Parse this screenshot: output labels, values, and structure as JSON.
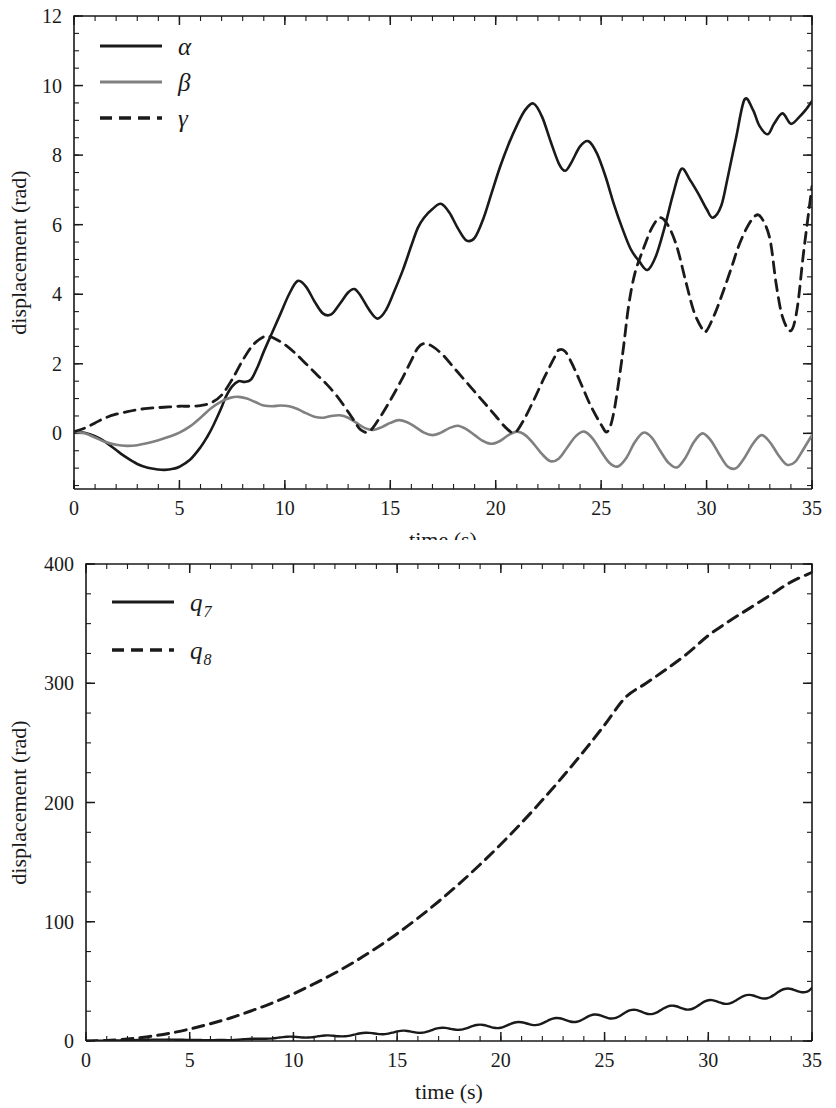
{
  "figure": {
    "background": "#ffffff",
    "ink": "#1a1a1a"
  },
  "chart_data": [
    {
      "id": "top",
      "type": "line",
      "title": "",
      "xlabel": "time (s)",
      "ylabel": "displacement (rad)",
      "xlim": [
        0,
        35
      ],
      "ylim": [
        -1.6,
        12
      ],
      "xticks": [
        0,
        5,
        10,
        15,
        20,
        25,
        30,
        35
      ],
      "xticklabels": [
        "0",
        "5",
        "10",
        "15",
        "20",
        "25",
        "30",
        "35"
      ],
      "yticks": [
        0,
        2,
        4,
        6,
        8,
        10,
        12
      ],
      "yticklabels": [
        "0",
        "2",
        "4",
        "6",
        "8",
        "10",
        "12"
      ],
      "x_minor_step": 1,
      "y_minor_step": 0.5,
      "grid": false,
      "legend_position": "upper-left",
      "legend": [
        {
          "label": "α",
          "style": "solid",
          "color": "#1a1a1a"
        },
        {
          "label": "β",
          "style": "solid",
          "color": "#808080"
        },
        {
          "label": "γ",
          "style": "dashed",
          "color": "#1a1a1a"
        }
      ],
      "series": [
        {
          "name": "α",
          "style": "solid",
          "color": "#1a1a1a",
          "width": 2.6,
          "x": [
            0,
            0.5,
            1,
            1.5,
            2,
            2.5,
            3,
            3.5,
            4,
            4.3,
            4.7,
            5,
            5.5,
            6,
            6.3,
            6.6,
            7,
            7.2,
            7.5,
            7.8,
            8.1,
            8.4,
            8.7,
            9,
            9.4,
            9.8,
            10.2,
            10.6,
            11,
            11.4,
            11.8,
            12.2,
            12.6,
            13,
            13.3,
            13.6,
            14,
            14.4,
            14.8,
            15.2,
            15.6,
            16,
            16.3,
            16.6,
            17,
            17.4,
            17.8,
            18.2,
            18.6,
            19,
            19.4,
            19.8,
            20.2,
            20.6,
            21,
            21.4,
            21.8,
            22.2,
            22.6,
            23,
            23.3,
            23.6,
            24,
            24.4,
            24.8,
            25.2,
            25.6,
            26,
            26.4,
            26.8,
            27.2,
            27.6,
            28,
            28.4,
            28.8,
            29.2,
            29.6,
            30,
            30.3,
            30.7,
            31,
            31.4,
            31.8,
            32.2,
            32.5,
            32.9,
            33.2,
            33.6,
            34,
            34.4,
            34.7,
            35
          ],
          "y": [
            0.05,
            0.02,
            -0.08,
            -0.25,
            -0.48,
            -0.7,
            -0.88,
            -0.99,
            -1.04,
            -1.05,
            -1.02,
            -0.96,
            -0.76,
            -0.4,
            -0.12,
            0.22,
            0.75,
            1.05,
            1.35,
            1.5,
            1.48,
            1.55,
            1.9,
            2.35,
            2.9,
            3.45,
            4.0,
            4.38,
            4.22,
            3.8,
            3.45,
            3.42,
            3.72,
            4.05,
            4.15,
            3.95,
            3.55,
            3.3,
            3.55,
            4.1,
            4.7,
            5.4,
            5.9,
            6.2,
            6.45,
            6.6,
            6.35,
            5.9,
            5.55,
            5.62,
            6.15,
            6.9,
            7.65,
            8.3,
            8.85,
            9.3,
            9.48,
            9.1,
            8.4,
            7.75,
            7.55,
            7.8,
            8.25,
            8.4,
            8.05,
            7.4,
            6.6,
            5.9,
            5.3,
            4.95,
            4.7,
            5.1,
            5.9,
            6.85,
            7.6,
            7.3,
            6.9,
            6.45,
            6.2,
            6.55,
            7.35,
            8.5,
            9.6,
            9.3,
            8.85,
            8.6,
            8.9,
            9.2,
            8.9,
            9.1,
            9.3,
            9.55,
            9.6,
            9.1,
            8.6,
            8.85,
            9.2,
            9.6,
            9.1,
            8.55,
            8.35,
            8.6,
            8.7,
            8.55,
            8.35,
            8.25,
            8.5,
            9.0,
            9.55,
            9.9,
            9.45,
            8.9,
            8.6,
            8.9,
            9.5,
            10.3,
            11.05,
            11.48,
            11.1,
            10.4,
            9.85,
            9.75,
            10.0,
            10.1,
            9.75,
            9.5,
            9.55,
            9.95,
            10.5,
            11.1,
            11.5,
            11.6
          ],
          "final_value": 11.6,
          "max_value": 11.6,
          "min_value": -1.05
        },
        {
          "name": "β",
          "style": "solid",
          "color": "#808080",
          "width": 2.6,
          "x": [
            0,
            0.5,
            1,
            1.5,
            2,
            2.5,
            3,
            3.5,
            4,
            4.5,
            5,
            5.5,
            6,
            6.5,
            7,
            7.4,
            7.8,
            8.2,
            8.6,
            9,
            9.4,
            9.8,
            10.2,
            10.6,
            11,
            11.4,
            11.8,
            12.2,
            12.6,
            13,
            13.4,
            13.8,
            14.2,
            14.6,
            15,
            15.4,
            15.8,
            16.2,
            16.6,
            17,
            17.4,
            17.8,
            18.2,
            18.6,
            19,
            19.4,
            19.8,
            20.2,
            20.6,
            21,
            21.4,
            21.8,
            22.2,
            22.6,
            23,
            23.4,
            23.8,
            24.2,
            24.6,
            25,
            25.4,
            25.8,
            26.2,
            26.6,
            27,
            27.4,
            27.8,
            28.2,
            28.6,
            29,
            29.4,
            29.8,
            30.2,
            30.6,
            31,
            31.4,
            31.8,
            32.2,
            32.6,
            33,
            33.4,
            33.8,
            34.2,
            34.6,
            35
          ],
          "y": [
            0.05,
            0.0,
            -0.12,
            -0.25,
            -0.33,
            -0.36,
            -0.34,
            -0.28,
            -0.2,
            -0.1,
            0.02,
            0.2,
            0.45,
            0.72,
            0.92,
            1.02,
            1.05,
            1.0,
            0.9,
            0.8,
            0.78,
            0.8,
            0.78,
            0.7,
            0.58,
            0.48,
            0.45,
            0.5,
            0.52,
            0.45,
            0.3,
            0.15,
            0.1,
            0.18,
            0.3,
            0.38,
            0.32,
            0.18,
            0.02,
            -0.05,
            0.02,
            0.15,
            0.22,
            0.12,
            -0.05,
            -0.22,
            -0.3,
            -0.22,
            -0.05,
            0.05,
            -0.05,
            -0.3,
            -0.6,
            -0.8,
            -0.72,
            -0.4,
            -0.08,
            0.05,
            -0.15,
            -0.52,
            -0.85,
            -0.95,
            -0.7,
            -0.25,
            0.02,
            -0.12,
            -0.5,
            -0.85,
            -0.98,
            -0.7,
            -0.25,
            0.0,
            -0.2,
            -0.6,
            -0.95,
            -1.0,
            -0.7,
            -0.3,
            -0.05,
            -0.25,
            -0.62,
            -0.9,
            -0.82,
            -0.45,
            -0.05
          ]
        },
        {
          "name": "γ",
          "style": "dashed",
          "color": "#1a1a1a",
          "width": 2.8,
          "x": [
            0,
            0.5,
            1,
            1.5,
            2,
            2.5,
            3,
            3.5,
            4,
            4.5,
            5,
            5.5,
            6,
            6.5,
            7,
            7.5,
            8,
            8.5,
            9,
            9.3,
            9.6,
            10,
            10.5,
            11,
            11.5,
            12,
            12.5,
            13,
            13.3,
            13.6,
            14,
            14.5,
            15,
            15.5,
            16,
            16.3,
            16.6,
            17,
            17.5,
            18,
            18.5,
            19,
            19.5,
            20,
            20.5,
            20.9,
            21.3,
            21.8,
            22.3,
            22.8,
            23,
            23.3,
            23.7,
            24.1,
            24.5,
            25,
            25.3,
            25.6,
            26,
            26.3,
            26.6,
            27,
            27.4,
            27.8,
            28.2,
            28.6,
            29,
            29.4,
            29.8,
            30,
            30.4,
            30.8,
            31.2,
            31.5,
            31.9,
            32.3,
            32.6,
            33,
            33.3,
            33.6,
            34,
            34.3,
            34.6,
            35
          ],
          "y": [
            0.05,
            0.15,
            0.3,
            0.45,
            0.55,
            0.62,
            0.68,
            0.72,
            0.74,
            0.76,
            0.78,
            0.78,
            0.8,
            0.88,
            1.1,
            1.55,
            2.1,
            2.55,
            2.78,
            2.78,
            2.7,
            2.55,
            2.3,
            2.0,
            1.7,
            1.4,
            1.05,
            0.62,
            0.35,
            0.1,
            0.05,
            0.45,
            0.95,
            1.5,
            2.1,
            2.45,
            2.58,
            2.5,
            2.25,
            1.9,
            1.55,
            1.2,
            0.85,
            0.5,
            0.15,
            0.02,
            0.35,
            0.95,
            1.6,
            2.2,
            2.4,
            2.35,
            1.9,
            1.35,
            0.8,
            0.25,
            0.05,
            0.6,
            2.2,
            3.65,
            4.6,
            5.3,
            5.9,
            6.2,
            5.95,
            5.35,
            4.4,
            3.5,
            3.0,
            2.95,
            3.45,
            4.1,
            4.8,
            5.35,
            5.9,
            6.25,
            6.2,
            5.6,
            4.3,
            3.35,
            2.95,
            3.6,
            5.2,
            7.1,
            8.6,
            9.0,
            8.1,
            7.2,
            6.7,
            6.55,
            6.7,
            7.0
          ]
        }
      ]
    },
    {
      "id": "bottom",
      "type": "line",
      "title": "",
      "xlabel": "time (s)",
      "ylabel": "displacement (rad)",
      "xlim": [
        0,
        35
      ],
      "ylim": [
        0,
        400
      ],
      "xticks": [
        0,
        5,
        10,
        15,
        20,
        25,
        30,
        35
      ],
      "xticklabels": [
        "0",
        "5",
        "10",
        "15",
        "20",
        "25",
        "30",
        "35"
      ],
      "yticks": [
        0,
        100,
        200,
        300,
        400
      ],
      "yticklabels": [
        "0",
        "100",
        "200",
        "300",
        "400"
      ],
      "x_minor_step": 1,
      "y_minor_step": 25,
      "grid": false,
      "legend_position": "upper-left",
      "legend": [
        {
          "label": "q",
          "sub": "7",
          "style": "solid",
          "color": "#1a1a1a"
        },
        {
          "label": "q",
          "sub": "8",
          "style": "dashed",
          "color": "#1a1a1a"
        }
      ],
      "series": [
        {
          "name": "q7",
          "style": "solid",
          "color": "#1a1a1a",
          "width": 2.4,
          "x": [
            0,
            1,
            2,
            3,
            4,
            5,
            6,
            7,
            8,
            9,
            10,
            11,
            12,
            13,
            14,
            15,
            16,
            17,
            18,
            19,
            20,
            21,
            22,
            23,
            24,
            25,
            26,
            27,
            28,
            29,
            30,
            31,
            32,
            33,
            34,
            35
          ],
          "y": [
            0,
            0.3,
            0.6,
            1.1,
            1.2,
            0.9,
            0.7,
            0.9,
            1.6,
            2.5,
            3.3,
            3.6,
            4.2,
            5.4,
            6.6,
            7.2,
            8.0,
            9.4,
            11.0,
            12.0,
            12.8,
            14.2,
            16.0,
            17.6,
            18.8,
            20.6,
            22.8,
            24.8,
            26.5,
            28.8,
            31.5,
            34.0,
            36.2,
            39.0,
            42.0,
            44.5
          ],
          "final_value": 44.5,
          "oscillation": "small ripple superimposed on rising trend"
        },
        {
          "name": "q8",
          "style": "dashed",
          "color": "#1a1a1a",
          "width": 3.0,
          "x": [
            0,
            1,
            2,
            3,
            4,
            5,
            6,
            7,
            8,
            9,
            10,
            11,
            12,
            13,
            14,
            15,
            16,
            17,
            18,
            19,
            20,
            21,
            22,
            23,
            24,
            25,
            26,
            27,
            28,
            29,
            30,
            31,
            32,
            33,
            34,
            35
          ],
          "y": [
            0,
            0.4,
            1.6,
            3.6,
            6.4,
            10,
            14.5,
            19.5,
            25.5,
            32,
            39.5,
            48,
            57,
            67,
            78,
            90,
            103,
            117,
            132,
            148,
            165,
            183,
            202,
            222,
            243,
            265,
            288,
            300,
            312,
            325,
            340,
            352,
            363,
            374,
            385,
            393
          ],
          "final_value": 393
        }
      ]
    }
  ]
}
